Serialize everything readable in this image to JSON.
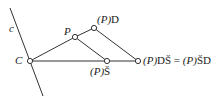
{
  "diagram": {
    "line_c": {
      "label": "c",
      "x1": 10,
      "y1": 8,
      "x2": 43,
      "y2": 96
    },
    "nodes": [
      {
        "id": "C",
        "label": "C",
        "x": 30,
        "y": 61
      },
      {
        "id": "P",
        "label": "P",
        "x": 75,
        "y": 37
      },
      {
        "id": "PD",
        "label": "(P)D",
        "x": 94,
        "y": 28
      },
      {
        "id": "PS",
        "label": "(P)Š",
        "x": 107,
        "y": 61
      },
      {
        "id": "PDS",
        "label": "(P)DŠ = (P)ŠD",
        "x": 138,
        "y": 61
      }
    ],
    "edges": [
      [
        "C",
        "P"
      ],
      [
        "P",
        "PD"
      ],
      [
        "P",
        "PS"
      ],
      [
        "PD",
        "PDS"
      ],
      [
        "C",
        "PS"
      ],
      [
        "PS",
        "PDS"
      ]
    ],
    "labels": {
      "c": "c",
      "C": "C",
      "P": "P",
      "PD_paren": "(P)",
      "PD_rest": "D",
      "PS_paren": "(P)",
      "PS_rest": "Š",
      "PDS_paren1": "(P)",
      "PDS_rest1": "DŠ",
      "PDS_eq": " = ",
      "PDS_paren2": "(P)",
      "PDS_rest2": "ŠD"
    },
    "colors": {
      "stroke": "#333333",
      "node_fill": "#ffffff"
    }
  }
}
